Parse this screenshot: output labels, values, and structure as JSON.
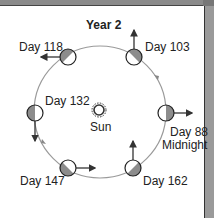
{
  "title": "Year 2",
  "sun": {
    "label": "Sun"
  },
  "positions": [
    {
      "day": "Day 88",
      "note": "Midnight",
      "shading": "right-half",
      "arrow": "right"
    },
    {
      "day": "Day 103",
      "note": "",
      "shading": "upper-right",
      "arrow": "up"
    },
    {
      "day": "Day 118",
      "note": "",
      "shading": "upper-left",
      "arrow": "left"
    },
    {
      "day": "Day 132",
      "note": "",
      "shading": "left-half",
      "arrow": "down"
    },
    {
      "day": "Day 147",
      "note": "",
      "shading": "lower-left",
      "arrow": "right"
    },
    {
      "day": "Day 162",
      "note": "",
      "shading": "lower-right",
      "arrow": "up"
    }
  ],
  "orbit_direction": "counterclockwise",
  "colors": {
    "orbit": "#9a9a9a",
    "shade": "#8c8c8c",
    "frame": "#8a8a8a",
    "ink": "#222222"
  }
}
